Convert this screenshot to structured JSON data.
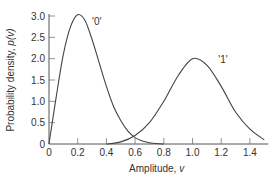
{
  "chart_data": {
    "type": "line",
    "title": "",
    "xlabel": "Amplitude, v",
    "ylabel": "Probability density, p(v)",
    "xlim": [
      0,
      1.5
    ],
    "ylim": [
      0,
      3.0
    ],
    "xticks": [
      "0",
      "0.2",
      "0.4",
      "0.6",
      "0.8",
      "1.0",
      "1.2",
      "1.4"
    ],
    "yticks": [
      "0",
      "0.5",
      "1.0",
      "1.5",
      "2.0",
      "2.5",
      "3.0"
    ],
    "grid": false,
    "legend": "none (inline curve labels)",
    "series": [
      {
        "name": "'0'",
        "x": [
          0,
          0.05,
          0.1,
          0.15,
          0.2,
          0.25,
          0.3,
          0.35,
          0.4,
          0.45,
          0.5,
          0.55,
          0.6,
          0.65,
          0.7,
          0.75,
          0.8
        ],
        "values": [
          0,
          1.1,
          2.1,
          2.75,
          3.03,
          2.9,
          2.45,
          1.9,
          1.35,
          0.88,
          0.55,
          0.3,
          0.15,
          0.07,
          0.03,
          0.01,
          0
        ]
      },
      {
        "name": "'1'",
        "x": [
          0.4,
          0.5,
          0.6,
          0.7,
          0.8,
          0.9,
          1.0,
          1.1,
          1.2,
          1.3,
          1.4,
          1.5
        ],
        "values": [
          0,
          0.05,
          0.2,
          0.5,
          1.0,
          1.6,
          2.0,
          1.85,
          1.35,
          0.75,
          0.35,
          0.1
        ]
      }
    ],
    "annotations": [
      {
        "text": "'0'",
        "x": 0.3,
        "y": 2.8
      },
      {
        "text": "'1'",
        "x": 1.18,
        "y": 1.9
      }
    ]
  },
  "labels": {
    "xlabel": "Amplitude, ",
    "xlabel_var": "v",
    "ylabel": "Probability density, ",
    "ylabel_var": "p(v)",
    "curve0": "'0'",
    "curve1": "'1'"
  }
}
